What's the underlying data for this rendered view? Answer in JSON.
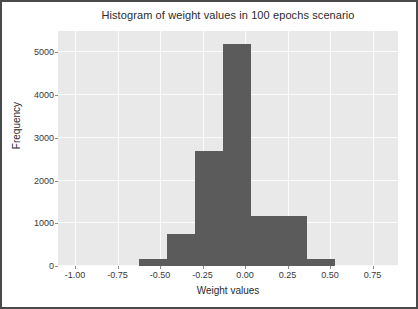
{
  "figure": {
    "background_color": "#ffffff",
    "border_color": "#4a4a4a",
    "plot_background_color": "#e9e9e9",
    "grid_color": "#fbfbfb",
    "bar_color": "#5b5b5b"
  },
  "chart_data": {
    "type": "bar",
    "title": "Histogram of weight values in 100 epochs scenario",
    "xlabel": "Weight values",
    "ylabel": "Frequency",
    "xlim": [
      -1.1,
      0.9
    ],
    "ylim": [
      0,
      5500
    ],
    "grid": true,
    "legend": null,
    "xticks": [
      -1.0,
      -0.75,
      -0.5,
      -0.25,
      0.0,
      0.25,
      0.5,
      0.75
    ],
    "xtick_labels": [
      "-1.00",
      "-0.75",
      "-0.50",
      "-0.25",
      "0.00",
      "0.25",
      "0.50",
      "0.75"
    ],
    "yticks": [
      0,
      1000,
      2000,
      3000,
      4000,
      5000
    ],
    "ytick_labels": [
      "0",
      "1000",
      "2000",
      "3000",
      "4000",
      "5000"
    ],
    "bin_edges": [
      -0.625,
      -0.46,
      -0.295,
      -0.13,
      0.035,
      0.2,
      0.365,
      0.53
    ],
    "categories": [
      "-0.625 to -0.46",
      "-0.46 to -0.295",
      "-0.295 to -0.13",
      "-0.13 to 0.035",
      "0.035 to 0.2",
      "0.2 to 0.365",
      "0.365 to 0.53"
    ],
    "values": [
      170,
      750,
      2700,
      5200,
      5200,
      1180,
      170
    ],
    "bars": [
      {
        "x_start": -0.625,
        "x_end": -0.46,
        "value": 170
      },
      {
        "x_start": -0.46,
        "x_end": -0.295,
        "value": 750
      },
      {
        "x_start": -0.295,
        "x_end": -0.13,
        "value": 2700
      },
      {
        "x_start": -0.13,
        "x_end": 0.035,
        "value": 5200
      },
      {
        "x_start": 0.035,
        "x_end": 0.2,
        "value": 1180
      },
      {
        "x_start": 0.2,
        "x_end": 0.365,
        "value": 1180
      },
      {
        "x_start": 0.365,
        "x_end": 0.53,
        "value": 170
      }
    ]
  }
}
